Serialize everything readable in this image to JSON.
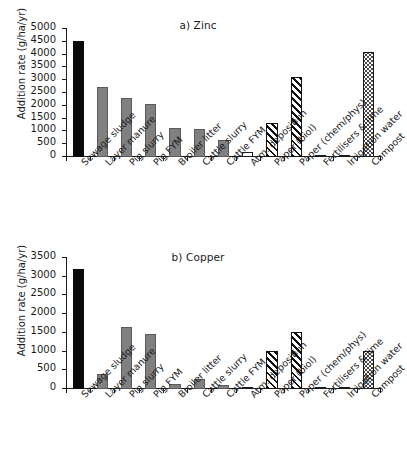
{
  "figure": {
    "width": 396,
    "height": 466,
    "background": "#ffffff"
  },
  "chart_data": [
    {
      "type": "bar",
      "panel_id": "a",
      "title": "a) Zinc",
      "xlabel": "",
      "ylabel": "Addition rate (g/ha/yr)",
      "ylim": [
        0,
        5000
      ],
      "yticks": [
        0,
        500,
        1000,
        1500,
        2000,
        2500,
        3000,
        3500,
        4000,
        4500,
        5000
      ],
      "grid": false,
      "legend": "none",
      "categories": [
        "Sewage sludge",
        "Layer manure",
        "Pig slurry",
        "Pig FYM",
        "Broiler litter",
        "Cattle slurry",
        "Cattle FYM",
        "Atm. deposition",
        "Paper (biol)",
        "Paper (chem/phys)",
        "Fertilisers & lime",
        "Irrigation water",
        "Compost"
      ],
      "values": [
        4550,
        2720,
        2300,
        2080,
        1120,
        1100,
        680,
        190,
        1330,
        3110,
        50,
        20,
        4120
      ],
      "bar_styles": [
        "solid-black",
        "grey",
        "grey",
        "grey",
        "grey",
        "grey",
        "grey",
        "open",
        "hatch",
        "hatch",
        "open",
        "open",
        "dots"
      ]
    },
    {
      "type": "bar",
      "panel_id": "b",
      "title": "b) Copper",
      "xlabel": "",
      "ylabel": "Addition rate (g/ha/yr)",
      "ylim": [
        0,
        3500
      ],
      "yticks": [
        0,
        500,
        1000,
        1500,
        2000,
        2500,
        3000,
        3500
      ],
      "grid": false,
      "legend": "none",
      "categories": [
        "Sewage sludge",
        "Layer manure",
        "Pig slurry",
        "Pig FYM",
        "Broiler litter",
        "Cattle slurry",
        "Cattle FYM",
        "Atm. deposition",
        "Paper (biol)",
        "Paper (chem/phys)",
        "Fertilisers & lime",
        "Irrigation water",
        "Compost"
      ],
      "values": [
        3200,
        400,
        1660,
        1460,
        140,
        260,
        120,
        30,
        1020,
        1530,
        15,
        10,
        1010
      ],
      "bar_styles": [
        "solid-black",
        "grey",
        "grey",
        "grey",
        "grey",
        "grey",
        "grey",
        "open",
        "hatch",
        "hatch",
        "open",
        "open",
        "dots"
      ]
    }
  ]
}
